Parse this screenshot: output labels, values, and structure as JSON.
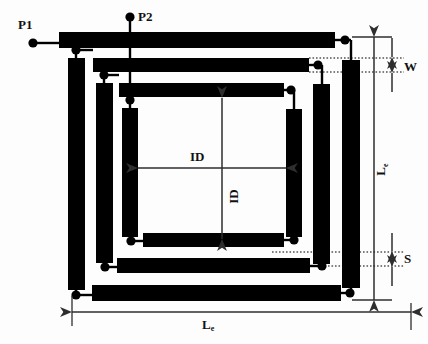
{
  "figure": {
    "colors": {
      "metal": "#000000",
      "background": "#fdfdfd",
      "dimension_line": "#3a3a3a",
      "dotted_guide": "#000000",
      "label_text": "#111111"
    }
  },
  "ports": [
    {
      "id": "p1",
      "label": "P1",
      "x": 20,
      "y": 20
    },
    {
      "id": "p2",
      "label": "P2",
      "x": 130,
      "y": 12
    }
  ],
  "dimensions": [
    {
      "id": "w",
      "label": "W",
      "sub": "",
      "orientation": "vertical",
      "x": 408,
      "y": 68,
      "meaning": "conductor trace width"
    },
    {
      "id": "s",
      "label": "S",
      "sub": "",
      "orientation": "vertical",
      "x": 408,
      "y": 260,
      "meaning": "spacing between turns"
    },
    {
      "id": "le_right",
      "label": "L",
      "sub": "e",
      "orientation": "vertical",
      "x": 386,
      "y": 175,
      "meaning": "outer edge length (vertical)"
    },
    {
      "id": "le_bottom",
      "label": "L",
      "sub": "e",
      "orientation": "horizontal",
      "x": 210,
      "y": 323,
      "meaning": "outer edge length (horizontal)"
    },
    {
      "id": "id_horizontal",
      "label": "ID",
      "sub": "",
      "orientation": "horizontal",
      "x": 200,
      "y": 158,
      "meaning": "inner diameter (horizontal)"
    },
    {
      "id": "id_vertical",
      "label": "ID",
      "sub": "",
      "orientation": "vertical",
      "x": 235,
      "y": 200,
      "meaning": "inner diameter (vertical)"
    }
  ],
  "geometry": {
    "trace_width": 15,
    "turns": 3,
    "top_bars": [
      {
        "x": 59,
        "y": 32,
        "w": 276,
        "h": 16
      },
      {
        "x": 93,
        "y": 58,
        "w": 216,
        "h": 14
      },
      {
        "x": 119,
        "y": 83,
        "w": 165,
        "h": 14
      }
    ],
    "right_bars": [
      {
        "x": 342,
        "y": 60,
        "w": 18,
        "h": 228
      },
      {
        "x": 313,
        "y": 84,
        "w": 17,
        "h": 180
      },
      {
        "x": 286,
        "y": 109,
        "w": 16,
        "h": 128
      }
    ],
    "bottom_bars": [
      {
        "x": 92,
        "y": 285,
        "w": 249,
        "h": 16
      },
      {
        "x": 117,
        "y": 258,
        "w": 193,
        "h": 15
      },
      {
        "x": 143,
        "y": 233,
        "w": 141,
        "h": 14
      }
    ],
    "left_bars": [
      {
        "x": 68,
        "y": 58,
        "w": 17,
        "h": 232
      },
      {
        "x": 96,
        "y": 83,
        "w": 17,
        "h": 180
      },
      {
        "x": 122,
        "y": 108,
        "w": 16,
        "h": 129
      }
    ],
    "junction_dots": [
      {
        "x": 33,
        "y": 43
      },
      {
        "x": 130,
        "y": 17
      },
      {
        "x": 345,
        "y": 40
      },
      {
        "x": 318,
        "y": 65
      },
      {
        "x": 291,
        "y": 90
      },
      {
        "x": 76,
        "y": 50
      },
      {
        "x": 104,
        "y": 75
      },
      {
        "x": 130,
        "y": 100
      },
      {
        "x": 76,
        "y": 295
      },
      {
        "x": 105,
        "y": 267
      },
      {
        "x": 131,
        "y": 241
      },
      {
        "x": 350,
        "y": 293
      },
      {
        "x": 322,
        "y": 266
      },
      {
        "x": 294,
        "y": 240
      }
    ]
  }
}
